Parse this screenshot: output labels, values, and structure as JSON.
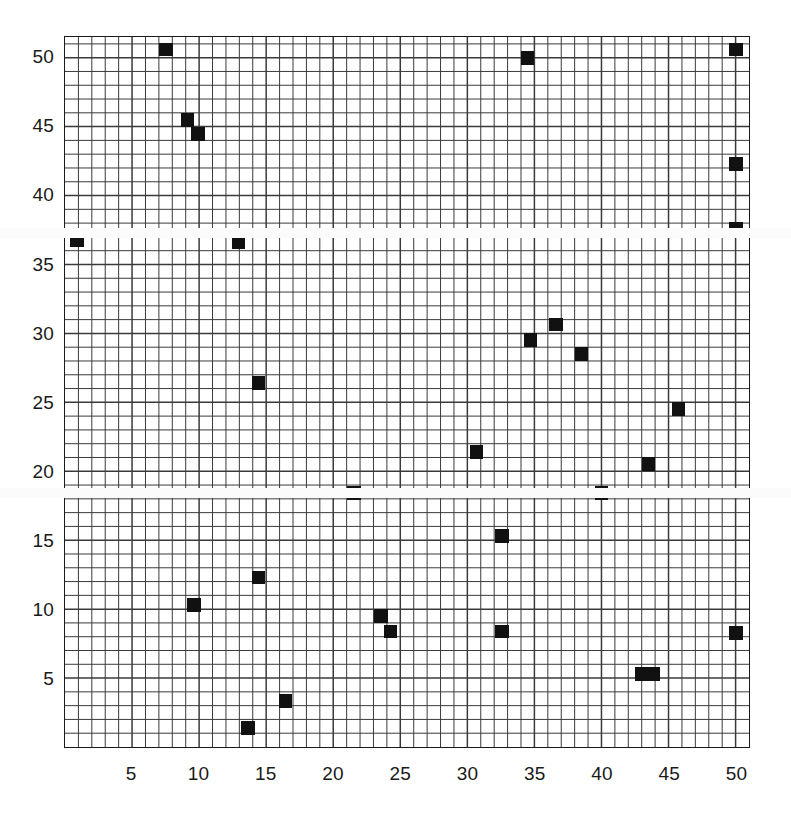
{
  "chart_data": {
    "type": "scatter",
    "title": "",
    "subtitle": "",
    "xlabel": "",
    "ylabel": "",
    "xlim": [
      0,
      51
    ],
    "ylim": [
      0,
      51.5
    ],
    "grid": true,
    "grid_minor_step": 1,
    "legend": null,
    "marker_style": "filled-square",
    "marker_color": "#111111",
    "xticks": [
      5,
      10,
      15,
      20,
      25,
      30,
      35,
      40,
      45,
      50
    ],
    "yticks": [
      5,
      10,
      15,
      20,
      25,
      30,
      35,
      40,
      45,
      50
    ],
    "xtick_labels": [
      "5",
      "10",
      "15",
      "20",
      "25",
      "30",
      "35",
      "40",
      "45",
      "50"
    ],
    "ytick_labels": [
      "5",
      "10",
      "15",
      "20",
      "25",
      "30",
      "35",
      "40",
      "45",
      "50"
    ],
    "points": [
      {
        "x": 7.5,
        "y": 50.6
      },
      {
        "x": 49.9,
        "y": 50.6
      },
      {
        "x": 34.4,
        "y": 50.0
      },
      {
        "x": 9.1,
        "y": 45.5
      },
      {
        "x": 9.9,
        "y": 44.5
      },
      {
        "x": 49.9,
        "y": 42.3
      },
      {
        "x": 49.9,
        "y": 37.6
      },
      {
        "x": 0.9,
        "y": 36.8
      },
      {
        "x": 12.9,
        "y": 36.7
      },
      {
        "x": 36.5,
        "y": 30.7
      },
      {
        "x": 34.6,
        "y": 29.6
      },
      {
        "x": 38.4,
        "y": 28.6
      },
      {
        "x": 14.4,
        "y": 26.5
      },
      {
        "x": 45.6,
        "y": 24.6
      },
      {
        "x": 30.6,
        "y": 21.5
      },
      {
        "x": 43.4,
        "y": 20.6
      },
      {
        "x": 21.5,
        "y": 18.5
      },
      {
        "x": 39.9,
        "y": 18.5
      },
      {
        "x": 32.5,
        "y": 15.4
      },
      {
        "x": 14.4,
        "y": 12.4
      },
      {
        "x": 9.6,
        "y": 10.4
      },
      {
        "x": 23.5,
        "y": 9.6
      },
      {
        "x": 24.2,
        "y": 8.5
      },
      {
        "x": 32.5,
        "y": 8.5
      },
      {
        "x": 49.9,
        "y": 8.4
      },
      {
        "x": 42.9,
        "y": 5.4
      },
      {
        "x": 43.7,
        "y": 5.4
      },
      {
        "x": 16.4,
        "y": 3.5
      },
      {
        "x": 13.6,
        "y": 1.5
      }
    ]
  },
  "axes": {
    "frame_color": "#1a1a1a",
    "grid_color": "#3a3a3a",
    "background": "#ffffff"
  }
}
